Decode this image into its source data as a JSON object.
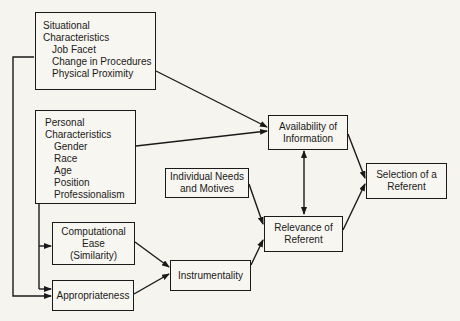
{
  "diagram": {
    "nodes": {
      "situational": {
        "title_line1": "Situational",
        "title_line2": "Characteristics",
        "items": [
          "Job Facet",
          "Change in Procedures",
          "Physical Proximity"
        ]
      },
      "personal": {
        "title_line1": "Personal",
        "title_line2": "Characteristics",
        "items": [
          "Gender",
          "Race",
          "Age",
          "Position",
          "Professionalism"
        ]
      },
      "computational_ease": {
        "line1": "Computational",
        "line2": "Ease",
        "line3": "(Similarity)"
      },
      "appropriateness": {
        "label": "Appropriateness"
      },
      "instrumentality": {
        "label": "Instrumentality"
      },
      "individual_needs": {
        "line1": "Individual Needs",
        "line2": "and Motives"
      },
      "availability": {
        "line1": "Availability of",
        "line2": "Information"
      },
      "relevance": {
        "line1": "Relevance of",
        "line2": "Referent"
      },
      "selection": {
        "line1": "Selection of a",
        "line2": "Referent"
      }
    },
    "edges": [
      {
        "from": "Situational Characteristics",
        "to": "Availability of Information"
      },
      {
        "from": "Personal Characteristics",
        "to": "Availability of Information"
      },
      {
        "from": "Personal Characteristics",
        "to": "Computational Ease (Similarity)"
      },
      {
        "from": "Personal Characteristics",
        "to": "Appropriateness"
      },
      {
        "from": "Situational Characteristics",
        "to": "Appropriateness"
      },
      {
        "from": "Computational Ease (Similarity)",
        "to": "Instrumentality"
      },
      {
        "from": "Appropriateness",
        "to": "Instrumentality"
      },
      {
        "from": "Instrumentality",
        "to": "Relevance of Referent"
      },
      {
        "from": "Individual Needs and Motives",
        "to": "Relevance of Referent"
      },
      {
        "from": "Availability of Information",
        "to": "Relevance of Referent",
        "bidirectional": true
      },
      {
        "from": "Availability of Information",
        "to": "Selection of a Referent"
      },
      {
        "from": "Relevance of Referent",
        "to": "Selection of a Referent"
      }
    ]
  }
}
